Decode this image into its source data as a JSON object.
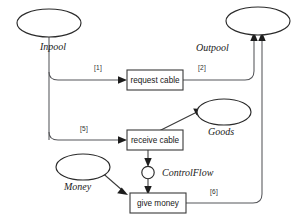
{
  "diagram": {
    "background": "#ffffff",
    "stroke_color": "#55565a",
    "node_stroke": "#2b2b2b",
    "places": [
      {
        "id": "inpool",
        "label": "Inpool",
        "shape": "ellipse"
      },
      {
        "id": "outpool",
        "label": "Outpool",
        "shape": "ellipse"
      },
      {
        "id": "goods",
        "label": "Goods",
        "shape": "ellipse"
      },
      {
        "id": "money",
        "label": "Money",
        "shape": "ellipse"
      },
      {
        "id": "controlflow",
        "label": "ControlFlow",
        "shape": "circle"
      }
    ],
    "transitions": [
      {
        "id": "request-cable",
        "label": "request cable"
      },
      {
        "id": "receive-cable",
        "label": "receive cable"
      },
      {
        "id": "give-money",
        "label": "give money"
      }
    ],
    "edges": [
      {
        "id": "e1",
        "label": "[1]",
        "from": "inpool",
        "to": "request-cable"
      },
      {
        "id": "e2",
        "label": "[2]",
        "from": "request-cable",
        "to": "outpool"
      },
      {
        "id": "e5",
        "label": "[5]",
        "from": "inpool",
        "to": "receive-cable"
      },
      {
        "id": "e6",
        "label": "[6]",
        "from": "give-money",
        "to": "outpool"
      },
      {
        "id": "e-goods",
        "label": "",
        "from": "receive-cable",
        "to": "goods"
      },
      {
        "id": "e-ctrl-in",
        "label": "",
        "from": "receive-cable",
        "to": "controlflow"
      },
      {
        "id": "e-ctrl-out",
        "label": "",
        "from": "controlflow",
        "to": "give-money"
      },
      {
        "id": "e-money",
        "label": "",
        "from": "money",
        "to": "give-money"
      }
    ]
  }
}
